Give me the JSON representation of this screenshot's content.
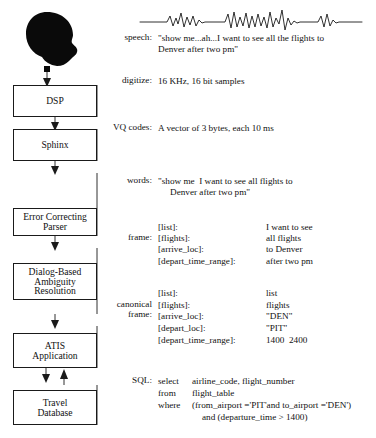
{
  "figure": {
    "type": "pipeline-diagram"
  },
  "speaker": {
    "icon": "head-silhouette-icon"
  },
  "waveform": {
    "icon": "speech-waveform-icon",
    "description": "speech signal waveform"
  },
  "modules": [
    {
      "id": "dsp",
      "label": "DSP"
    },
    {
      "id": "sphinx",
      "label": "Sphinx"
    },
    {
      "id": "parser",
      "line1": "Error Correcting",
      "line2": "Parser"
    },
    {
      "id": "dialog",
      "line1": "Dialog-Based",
      "line2": "Ambiguity",
      "line3": "Resolution"
    },
    {
      "id": "atis",
      "line1": "ATIS",
      "line2": "Application"
    },
    {
      "id": "db",
      "line1": "Travel",
      "line2": "Database"
    }
  ],
  "stages": [
    {
      "id": "speech",
      "label": "speech:",
      "value_line1": "\"show me...ah...I want to see all the flights to",
      "value_line2": "Denver after two pm\""
    },
    {
      "id": "digitize",
      "label": "digitize:",
      "value_line1": "16 KHz, 16 bit samples"
    },
    {
      "id": "vq",
      "label": "VQ codes:",
      "value_line1": "A vector of 3 bytes, each 10 ms"
    },
    {
      "id": "words",
      "label": "words:",
      "value_line1": "\"show me  I want to see all flights to",
      "value_line2": "Denver after two pm\""
    }
  ],
  "frame": {
    "label": "frame:",
    "rows": [
      {
        "key": "[list]:",
        "value": "I want to see"
      },
      {
        "key": "[flights]:",
        "value": "all flights"
      },
      {
        "key": "[arrive_loc]:",
        "value": "to Denver"
      },
      {
        "key": "[depart_time_range]:",
        "value": "after two pm"
      }
    ]
  },
  "canonical_frame": {
    "label_line1": "canonical",
    "label_line2": "frame:",
    "rows": [
      {
        "key": "[list]:",
        "value": "list"
      },
      {
        "key": "[flights]:",
        "value": "flights"
      },
      {
        "key": "[arrive_loc]:",
        "value": "\"DEN\""
      },
      {
        "key": "[depart_loc]:",
        "value": "\"PIT\""
      },
      {
        "key": "[depart_time_range]:",
        "value": "1400  2400"
      }
    ]
  },
  "sql": {
    "label": "SQL:",
    "lines": [
      {
        "keyword": "select",
        "text": "airline_code, flight_number"
      },
      {
        "keyword": "from",
        "text": "flight_table"
      },
      {
        "keyword": "where",
        "text": "(from_airport ='PIT'and to_airport ='DEN')"
      },
      {
        "keyword": "",
        "text": "and (departure_time > 1400)"
      }
    ]
  },
  "colors": {
    "ink": "#111111",
    "background": "#ffffff",
    "line": "#1a1a1a"
  }
}
